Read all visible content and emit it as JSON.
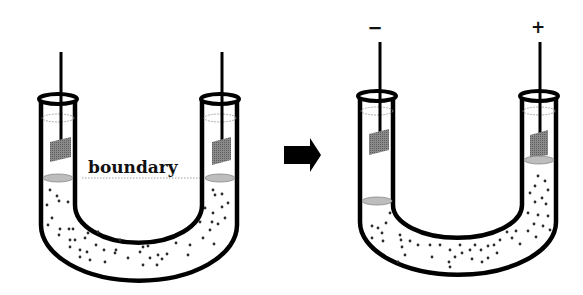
{
  "diagram": {
    "before": {
      "label": "boundary",
      "electrodes": [
        "left-electrode",
        "right-electrode"
      ]
    },
    "transition_arrow": "right-arrow",
    "after": {
      "left_electrode_sign": "−",
      "right_electrode_sign": "+",
      "description": "Colloidal particles migrate toward the positive electrode; boundary drops on the negative side and rises on the positive side."
    },
    "colors": {
      "outline": "#000000",
      "electrode_plate": "#7a7a7a",
      "boundary_disc": "#bdbdbd",
      "particle": "#2b2b2b",
      "background": "#ffffff"
    }
  }
}
